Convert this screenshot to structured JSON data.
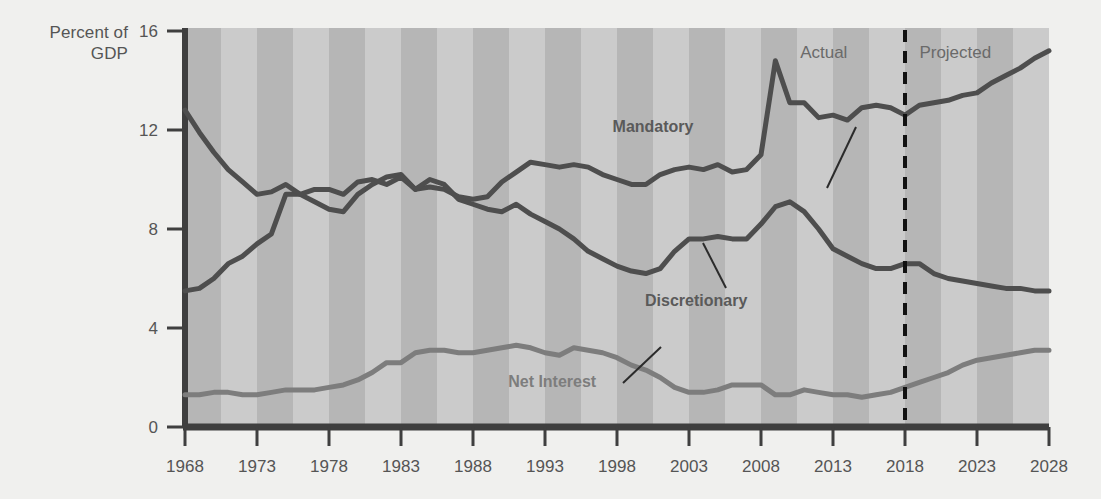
{
  "chart_data": {
    "type": "line",
    "title": "",
    "subtitle": "",
    "ylabel": "Percent of\nGDP",
    "xlabel": "",
    "xlim": [
      1968,
      2028
    ],
    "ylim": [
      0,
      16
    ],
    "yticks": [
      0,
      4,
      8,
      12,
      16
    ],
    "ytick_labels": [
      "0",
      "4",
      "8",
      "12",
      "16"
    ],
    "xticks": [
      1968,
      1973,
      1978,
      1983,
      1988,
      1993,
      1998,
      2003,
      2008,
      2013,
      2018,
      2023,
      2028
    ],
    "xtick_labels": [
      "1968",
      "1973",
      "1978",
      "1983",
      "1988",
      "1993",
      "1998",
      "2003",
      "2008",
      "2013",
      "2018",
      "2023",
      "2028"
    ],
    "grid": false,
    "banding": "alternating vertical gray bands every 2.5 years",
    "legend": "inline annotations with leader lines",
    "annotations": [
      {
        "text": "Mandatory",
        "x": 2000.5,
        "y": 11.9,
        "color": "#5a5a5a"
      },
      {
        "text": "Discretionary",
        "x": 2003.5,
        "y": 4.9,
        "color": "#5a5a5a"
      },
      {
        "text": "Net Interest",
        "x": 1993.5,
        "y": 1.6,
        "color": "#7d7d7d"
      },
      {
        "text": "Actual",
        "x": 2014.0,
        "y": 14.9,
        "color": "#6a6a6a"
      },
      {
        "text": "Projected",
        "x": 2019.0,
        "y": 14.9,
        "color": "#6a6a6a"
      }
    ],
    "divider": {
      "x": 2018,
      "style": "dashed",
      "color": "#111111",
      "label_left": "Actual",
      "label_right": "Projected"
    },
    "x": [
      1968,
      1969,
      1970,
      1971,
      1972,
      1973,
      1974,
      1975,
      1976,
      1977,
      1978,
      1979,
      1980,
      1981,
      1982,
      1983,
      1984,
      1985,
      1986,
      1987,
      1988,
      1989,
      1990,
      1991,
      1992,
      1993,
      1994,
      1995,
      1996,
      1997,
      1998,
      1999,
      2000,
      2001,
      2002,
      2003,
      2004,
      2005,
      2006,
      2007,
      2008,
      2009,
      2010,
      2011,
      2012,
      2013,
      2014,
      2015,
      2016,
      2017,
      2018,
      2019,
      2020,
      2021,
      2022,
      2023,
      2024,
      2025,
      2026,
      2027,
      2028
    ],
    "series": [
      {
        "name": "Mandatory",
        "color": "#4e4e4e",
        "values": [
          5.5,
          5.6,
          6.0,
          6.6,
          6.9,
          7.4,
          7.8,
          9.4,
          9.4,
          9.1,
          8.8,
          8.7,
          9.4,
          9.8,
          10.1,
          10.2,
          9.6,
          9.7,
          9.6,
          9.3,
          9.2,
          9.3,
          9.9,
          10.3,
          10.7,
          10.6,
          10.5,
          10.6,
          10.5,
          10.2,
          10.0,
          9.8,
          9.8,
          10.2,
          10.4,
          10.5,
          10.4,
          10.6,
          10.3,
          10.4,
          11.0,
          14.8,
          13.1,
          13.1,
          12.5,
          12.6,
          12.4,
          12.9,
          13.0,
          12.9,
          12.6,
          13.0,
          13.1,
          13.2,
          13.4,
          13.5,
          13.9,
          14.2,
          14.5,
          14.9,
          15.2
        ]
      },
      {
        "name": "Discretionary",
        "color": "#4e4e4e",
        "values": [
          12.8,
          11.9,
          11.1,
          10.4,
          9.9,
          9.4,
          9.5,
          9.8,
          9.4,
          9.6,
          9.6,
          9.4,
          9.9,
          10.0,
          9.8,
          10.1,
          9.6,
          10.0,
          9.8,
          9.2,
          9.0,
          8.8,
          8.7,
          9.0,
          8.6,
          8.3,
          8.0,
          7.6,
          7.1,
          6.8,
          6.5,
          6.3,
          6.2,
          6.4,
          7.1,
          7.6,
          7.6,
          7.7,
          7.6,
          7.6,
          8.2,
          8.9,
          9.1,
          8.7,
          8.0,
          7.2,
          6.9,
          6.6,
          6.4,
          6.4,
          6.6,
          6.6,
          6.2,
          6.0,
          5.9,
          5.8,
          5.7,
          5.6,
          5.6,
          5.5,
          5.5
        ]
      },
      {
        "name": "Net Interest",
        "color": "#7d7d7d",
        "values": [
          1.3,
          1.3,
          1.4,
          1.4,
          1.3,
          1.3,
          1.4,
          1.5,
          1.5,
          1.5,
          1.6,
          1.7,
          1.9,
          2.2,
          2.6,
          2.6,
          3.0,
          3.1,
          3.1,
          3.0,
          3.0,
          3.1,
          3.2,
          3.3,
          3.2,
          3.0,
          2.9,
          3.2,
          3.1,
          3.0,
          2.8,
          2.5,
          2.3,
          2.0,
          1.6,
          1.4,
          1.4,
          1.5,
          1.7,
          1.7,
          1.7,
          1.3,
          1.3,
          1.5,
          1.4,
          1.3,
          1.3,
          1.2,
          1.3,
          1.4,
          1.6,
          1.8,
          2.0,
          2.2,
          2.5,
          2.7,
          2.8,
          2.9,
          3.0,
          3.1,
          3.1
        ]
      }
    ]
  },
  "colors": {
    "background": "#f0f0ee",
    "band_dark": "#b6b6b6",
    "band_light": "#cbcbcb",
    "axis": "#3f3f3f",
    "tick_text": "#555555",
    "line_dark": "#4e4e4e",
    "line_light": "#7d7d7d",
    "divider": "#111111"
  }
}
